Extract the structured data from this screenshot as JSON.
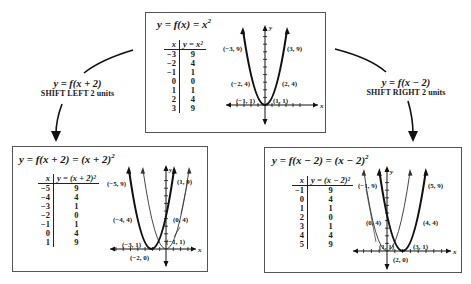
{
  "top": {
    "title": "y = f(x) = x",
    "title_exp": "2",
    "table": {
      "headers": [
        "x",
        "y = x²"
      ],
      "rows": [
        [
          "−3",
          "9"
        ],
        [
          "−2",
          "4"
        ],
        [
          "−1",
          "1"
        ],
        [
          "0",
          "0"
        ],
        [
          "1",
          "1"
        ],
        [
          "2",
          "4"
        ],
        [
          "3",
          "9"
        ]
      ]
    },
    "points": [
      "(−3, 9)",
      "(3, 9)",
      "(−2, 4)",
      "(2, 4)",
      "(−1, 1)",
      "(1, 1)"
    ],
    "axis_x": "x",
    "axis_y": "y"
  },
  "left_connector": {
    "equation": "y = f(x + 2)",
    "description": "SHIFT LEFT 2 units"
  },
  "right_connector": {
    "equation": "y = f(x − 2)",
    "description": "SHIFT RIGHT 2 units"
  },
  "left": {
    "title": "y = f(x + 2) = (x + 2)",
    "title_exp": "2",
    "table": {
      "headers": [
        "x",
        "y = (x + 2)²"
      ],
      "rows": [
        [
          "−5",
          "9"
        ],
        [
          "−4",
          "4"
        ],
        [
          "−3",
          "1"
        ],
        [
          "−2",
          "0"
        ],
        [
          "−1",
          "1"
        ],
        [
          "0",
          "4"
        ],
        [
          "1",
          "9"
        ]
      ]
    },
    "points": [
      "(−5, 9)",
      "(1, 9)",
      "(−4, 4)",
      "(0, 4)",
      "(−3, 1)",
      "(−1, 1)",
      "(−2, 0)"
    ],
    "axis_x": "x",
    "axis_y": "y"
  },
  "right": {
    "title": "y = f(x − 2) = (x − 2)",
    "title_exp": "2",
    "table": {
      "headers": [
        "x",
        "y = (x − 2)²"
      ],
      "rows": [
        [
          "−1",
          "9"
        ],
        [
          "0",
          "4"
        ],
        [
          "1",
          "1"
        ],
        [
          "2",
          "0"
        ],
        [
          "3",
          "1"
        ],
        [
          "4",
          "4"
        ],
        [
          "5",
          "9"
        ]
      ]
    },
    "points": [
      "(−1, 9)",
      "(5, 9)",
      "(0, 4)",
      "(4, 4)",
      "(1, 1)",
      "(3, 1)",
      "(2, 0)"
    ],
    "axis_x": "x",
    "axis_y": "y"
  }
}
